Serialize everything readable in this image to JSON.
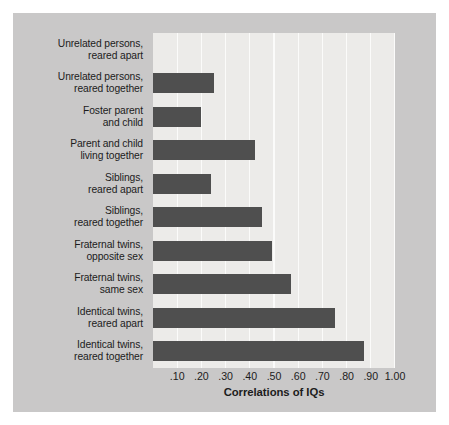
{
  "chart_data": {
    "type": "bar",
    "orientation": "horizontal",
    "title": "",
    "xlabel": "Correlations of IQs",
    "ylabel": "",
    "xlim": [
      0,
      1.0
    ],
    "grid": true,
    "legend": "none",
    "bar_color": "#4f4f4f",
    "plot_background": "#ecebe9",
    "panel_background": "#c9c8c8",
    "gridline_color": "#fbfbfa",
    "text_color": "#1c1c1c",
    "xticks": [
      0.1,
      0.2,
      0.3,
      0.4,
      0.5,
      0.6,
      0.7,
      0.8,
      0.9,
      1.0
    ],
    "xtick_labels": [
      ".10",
      ".20",
      ".30",
      ".40",
      ".50",
      ".60",
      ".70",
      ".80",
      ".90",
      "1.00"
    ],
    "categories": [
      "Unrelated persons, reared apart",
      "Unrelated persons, reared together",
      "Foster parent and child",
      "Parent and child living together",
      "Siblings, reared apart",
      "Siblings, reared together",
      "Fraternal twins, opposite sex",
      "Fraternal twins, same sex",
      "Identical twins, reared apart",
      "Identical twins, reared together"
    ],
    "category_lines": [
      [
        "Unrelated persons,",
        "reared apart"
      ],
      [
        "Unrelated persons,",
        "reared together"
      ],
      [
        "Foster parent",
        "and child"
      ],
      [
        "Parent and child",
        "living together"
      ],
      [
        "Siblings,",
        "reared apart"
      ],
      [
        "Siblings,",
        "reared together"
      ],
      [
        "Fraternal twins,",
        "opposite sex"
      ],
      [
        "Fraternal twins,",
        "same sex"
      ],
      [
        "Identical twins,",
        "reared apart"
      ],
      [
        "Identical twins,",
        "reared together"
      ]
    ],
    "values": [
      0.0,
      0.25,
      0.2,
      0.42,
      0.24,
      0.45,
      0.49,
      0.57,
      0.75,
      0.87
    ]
  }
}
